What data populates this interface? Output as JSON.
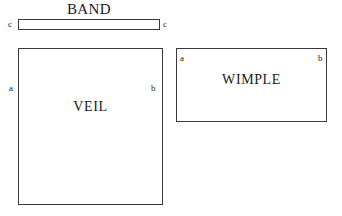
{
  "diagram": {
    "type": "sewing-pattern-pieces",
    "background_color": "#ffffff",
    "line_color": "#3a3a3a",
    "text_color": "#1a1a1a",
    "pieces": [
      {
        "id": "band",
        "title": "BAND",
        "title_position": "above",
        "shape": "rectangle",
        "corner_labels": [
          "c",
          "c"
        ],
        "edge_labels": {
          "left": "c",
          "right": "c"
        },
        "label_placement": "outside"
      },
      {
        "id": "veil",
        "title": "VEIL",
        "title_position": "inside",
        "shape": "rectangle",
        "corner_labels": [
          "a",
          "b"
        ],
        "edge_labels": {
          "left": "a",
          "right": "b"
        },
        "label_placement": "mixed"
      },
      {
        "id": "wimple",
        "title": "WIMPLE",
        "title_position": "inside",
        "shape": "rectangle",
        "corner_labels": [
          "a",
          "b"
        ],
        "edge_labels": {
          "left": "a",
          "right": "b"
        },
        "label_placement": "inside"
      }
    ]
  }
}
